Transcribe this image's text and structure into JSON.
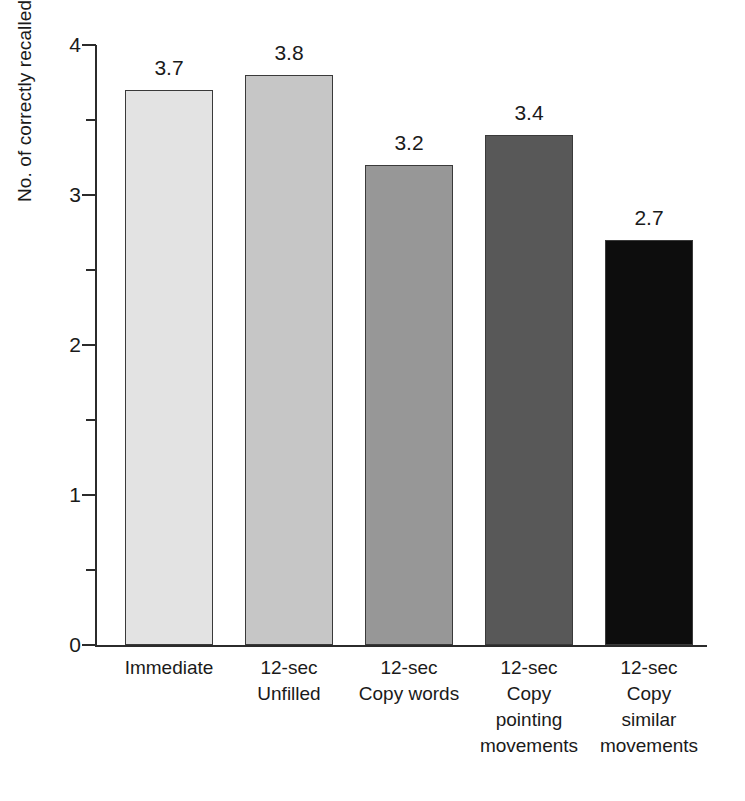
{
  "chart_data": {
    "type": "bar",
    "title": "",
    "xlabel": "",
    "ylabel": "No. of correctly recalled movements",
    "categories": [
      "Immediate",
      "12-sec Unfilled",
      "12-sec Copy words",
      "12-sec Copy pointing movements",
      "12-sec Copy similar movements"
    ],
    "category_lines": [
      [
        "Immediate"
      ],
      [
        "12-sec",
        "Unfilled"
      ],
      [
        "12-sec",
        "Copy words"
      ],
      [
        "12-sec",
        "Copy",
        "pointing",
        "movements"
      ],
      [
        "12-sec",
        "Copy",
        "similar",
        "movements"
      ]
    ],
    "values": [
      3.7,
      3.8,
      3.2,
      3.4,
      2.7
    ],
    "value_labels": [
      "3.7",
      "3.8",
      "3.2",
      "3.4",
      "2.7"
    ],
    "ylim": [
      0,
      4
    ],
    "y_major_ticks": [
      0,
      1,
      2,
      3,
      4
    ],
    "y_major_tick_labels": [
      "0",
      "1",
      "2",
      "3",
      "4"
    ],
    "y_minor_ticks": [
      0.5,
      1.5,
      2.5,
      3.5
    ],
    "grid": false,
    "legend": "none",
    "bar_colors": [
      "#e3e3e3",
      "#c6c6c6",
      "#979797",
      "#585858",
      "#0d0d0d"
    ],
    "bar_border_color": "#3a3a3a",
    "axis_color": "#2b2b2b",
    "background_color": "#ffffff"
  },
  "axis": {
    "y_title": "No. of correctly recalled movements"
  }
}
